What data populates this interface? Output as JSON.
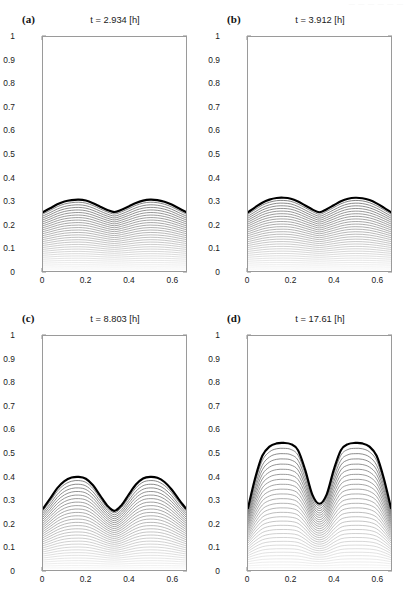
{
  "figure": {
    "width": 410,
    "height": 598,
    "background": "#ffffff",
    "faint_header": "— — — — — —"
  },
  "axes": {
    "x_ticks": [
      "0",
      "0.2",
      "0.4",
      "0.6"
    ],
    "x_tick_values": [
      0,
      0.2,
      0.4,
      0.6
    ],
    "y_ticks": [
      "0",
      "0.1",
      "0.2",
      "0.3",
      "0.4",
      "0.5",
      "0.6",
      "0.7",
      "0.8",
      "0.9",
      "1"
    ],
    "y_tick_values": [
      0,
      0.1,
      0.2,
      0.3,
      0.4,
      0.5,
      0.6,
      0.7,
      0.8,
      0.9,
      1
    ],
    "xlim": [
      0,
      0.667
    ],
    "ylim": [
      0,
      1
    ],
    "xlabel": "",
    "ylabel": "",
    "grid": false,
    "frame_color": "#9a9a9a"
  },
  "panels": [
    {
      "id": "a",
      "letter": "(a)",
      "title": "t = 2.934 [h]",
      "time_value": 2.934,
      "time_unit": "h"
    },
    {
      "id": "b",
      "letter": "(b)",
      "title": "t = 3.912 [h]",
      "time_value": 3.912,
      "time_unit": "h"
    },
    {
      "id": "c",
      "letter": "(c)",
      "title": "t = 8.803 [h]",
      "time_value": 8.803,
      "time_unit": "h"
    },
    {
      "id": "d",
      "letter": "(d)",
      "title": "t = 17.61 [h]",
      "time_value": 17.61,
      "time_unit": "h"
    }
  ],
  "chart_data": {
    "type": "line",
    "title": "",
    "xlabel": "",
    "ylabel": "",
    "xlim": [
      0,
      0.667
    ],
    "ylim": [
      0,
      1
    ],
    "grid": false,
    "legend": "none",
    "n_contour_levels": 30,
    "interface_linewidth_px": 2.2,
    "interface_color": "#000000",
    "contour_color_dark": "#666666",
    "contour_color_light": "#f0f0f0",
    "x_samples": [
      0,
      0.0333,
      0.0667,
      0.1,
      0.1333,
      0.1667,
      0.2,
      0.2333,
      0.2667,
      0.3,
      0.3333,
      0.3667,
      0.4,
      0.4333,
      0.4667,
      0.5,
      0.5333,
      0.5667,
      0.6,
      0.6333,
      0.667
    ],
    "series": [
      {
        "name": "a: t = 2.934 [h]",
        "panel": "a",
        "peak_height": 0.305,
        "valley_height": 0.252,
        "edge_height": 0.252,
        "values": [
          0.252,
          0.268,
          0.285,
          0.297,
          0.303,
          0.305,
          0.301,
          0.29,
          0.275,
          0.261,
          0.252,
          0.262,
          0.276,
          0.291,
          0.301,
          0.305,
          0.303,
          0.296,
          0.284,
          0.268,
          0.252
        ]
      },
      {
        "name": "b: t = 3.912 [h]",
        "panel": "b",
        "peak_height": 0.313,
        "valley_height": 0.251,
        "edge_height": 0.251,
        "values": [
          0.251,
          0.272,
          0.292,
          0.305,
          0.312,
          0.313,
          0.309,
          0.297,
          0.28,
          0.263,
          0.251,
          0.264,
          0.281,
          0.298,
          0.309,
          0.313,
          0.311,
          0.303,
          0.289,
          0.271,
          0.251
        ]
      },
      {
        "name": "c: t = 8.803 [h]",
        "panel": "c",
        "peak_height": 0.398,
        "valley_height": 0.253,
        "edge_height": 0.262,
        "values": [
          0.262,
          0.305,
          0.35,
          0.38,
          0.395,
          0.398,
          0.39,
          0.362,
          0.318,
          0.275,
          0.253,
          0.277,
          0.322,
          0.365,
          0.391,
          0.398,
          0.394,
          0.376,
          0.344,
          0.302,
          0.262
        ]
      },
      {
        "name": "d: t = 17.61 [h]",
        "panel": "d",
        "peak_height": 0.543,
        "valley_height": 0.283,
        "edge_height": 0.265,
        "values": [
          0.265,
          0.392,
          0.488,
          0.527,
          0.541,
          0.543,
          0.538,
          0.512,
          0.428,
          0.322,
          0.283,
          0.322,
          0.428,
          0.512,
          0.538,
          0.543,
          0.541,
          0.527,
          0.488,
          0.392,
          0.265
        ]
      }
    ]
  }
}
